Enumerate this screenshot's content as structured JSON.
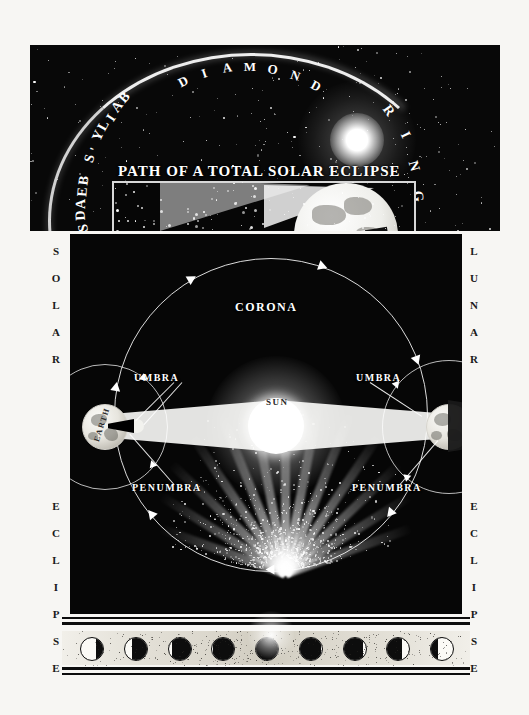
{
  "plate": {
    "title": "Path of a Total Solar Eclipse",
    "side_left_caption": "SOLAR ECLIPSE",
    "side_right_caption": "LUNAR ECLIPSE"
  },
  "top_panel": {
    "title": "PATH OF A TOTAL SOLAR ECLIPSE",
    "label_bailys_beads": "BAILY'S BEADS",
    "label_diamond": "DIAMOND",
    "label_ring": "RING"
  },
  "main_panel": {
    "label_corona": "CORONA",
    "label_sun": "SUN",
    "label_earth": "EARTH",
    "label_moon": "MOON",
    "label_umbra_left": "UMBRA",
    "label_umbra_right": "UMBRA",
    "label_penumbra_left": "PENUMBRA",
    "label_penumbra_right": "PENUMBRA"
  },
  "side_left_letters": [
    "S",
    "O",
    "L",
    "A",
    "R",
    "E",
    "C",
    "L",
    "I",
    "P",
    "S",
    "E"
  ],
  "side_right_letters": [
    "L",
    "U",
    "N",
    "A",
    "R",
    "E",
    "C",
    "L",
    "I",
    "P",
    "S",
    "E"
  ],
  "phase_strip": {
    "count": 9,
    "phases": [
      {
        "name": "partial-begin",
        "coverage": 0.3,
        "from": "right"
      },
      {
        "name": "partial",
        "coverage": 0.68,
        "from": "right"
      },
      {
        "name": "partial-deep",
        "coverage": 0.88,
        "from": "right"
      },
      {
        "name": "near-total",
        "coverage": 0.96,
        "from": "right"
      },
      {
        "name": "totality",
        "coverage": 1.0,
        "from": "right"
      },
      {
        "name": "near-total",
        "coverage": 0.96,
        "from": "left"
      },
      {
        "name": "partial-deep",
        "coverage": 0.88,
        "from": "left"
      },
      {
        "name": "partial",
        "coverage": 0.68,
        "from": "left"
      },
      {
        "name": "partial-end",
        "coverage": 0.3,
        "from": "left"
      }
    ]
  },
  "colors": {
    "ink": "#0a0a0a",
    "paper": "#f7f6f3",
    "light": "#ffffff"
  }
}
